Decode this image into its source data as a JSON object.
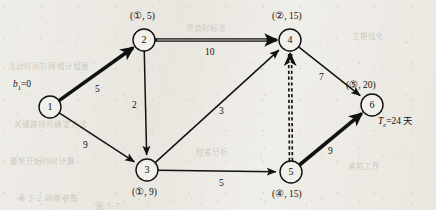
{
  "figure": {
    "type": "project-network-diagram",
    "background_color": "#eceae4",
    "ink_color": "#111111",
    "width": 436,
    "height": 210
  },
  "nodes": [
    {
      "id": "1",
      "number": "1",
      "x": 50,
      "y": 107,
      "r": 11,
      "label": "",
      "label_x": 14,
      "label_y": 80,
      "label_pos": "upper-left"
    },
    {
      "id": "2",
      "number": "2",
      "x": 144,
      "y": 40,
      "r": 11,
      "label": "(①, 5)",
      "label_x": 130,
      "label_y": 10,
      "label_pos": "above"
    },
    {
      "id": "3",
      "number": "3",
      "x": 147,
      "y": 170,
      "r": 11,
      "label": "(①, 9)",
      "label_x": 132,
      "label_y": 186,
      "label_pos": "below"
    },
    {
      "id": "4",
      "number": "4",
      "x": 290,
      "y": 40,
      "r": 11,
      "label": "(②, 15)",
      "label_x": 272,
      "label_y": 10,
      "label_pos": "above"
    },
    {
      "id": "5",
      "number": "5",
      "x": 291,
      "y": 172,
      "r": 11,
      "label": "(④, 15)",
      "label_x": 272,
      "label_y": 188,
      "label_pos": "below"
    },
    {
      "id": "6",
      "number": "6",
      "x": 372,
      "y": 105,
      "r": 11,
      "label": "(⑤, 20)",
      "label_x": 372,
      "label_y": 79,
      "label_pos": "above"
    }
  ],
  "edges": [
    {
      "from": "1",
      "to": "2",
      "weight": "5",
      "style": "bold",
      "weight_x": 95,
      "weight_y": 84
    },
    {
      "from": "1",
      "to": "3",
      "weight": "9",
      "style": "thin",
      "weight_x": 83,
      "weight_y": 140
    },
    {
      "from": "2",
      "to": "3",
      "weight": "2",
      "style": "thin",
      "weight_x": 132,
      "weight_y": 100
    },
    {
      "from": "2",
      "to": "4",
      "weight": "10",
      "style": "bold-double",
      "weight_x": 205,
      "weight_y": 47
    },
    {
      "from": "3",
      "to": "4",
      "weight": "3",
      "style": "thin",
      "weight_x": 219,
      "weight_y": 106
    },
    {
      "from": "3",
      "to": "5",
      "weight": "5",
      "style": "thin",
      "weight_x": 219,
      "weight_y": 178
    },
    {
      "from": "4",
      "to": "6",
      "weight": "7",
      "style": "thin",
      "weight_x": 319,
      "weight_y": 72
    },
    {
      "from": "5",
      "to": "4",
      "weight": "",
      "style": "dashed-double",
      "weight_x": 0,
      "weight_y": 0
    },
    {
      "from": "5",
      "to": "6",
      "weight": "9",
      "style": "bold",
      "weight_x": 328,
      "weight_y": 146
    }
  ],
  "annotations": [
    {
      "name": "source-label",
      "html": "<i>b</i><sub>1</sub>=0",
      "x": 13,
      "y": 79
    },
    {
      "name": "completion-time",
      "html": "<i>T<sub>e</sub></i>=24 天",
      "x": 378,
      "y": 113
    }
  ],
  "bleed_through": [
    {
      "text": "活动时间与网络计划图",
      "x": 8,
      "y": 60
    },
    {
      "text": "关键路线的确定方法",
      "x": 14,
      "y": 118
    },
    {
      "text": "最早开始时间计算",
      "x": 10,
      "y": 155
    },
    {
      "text": "表 5-2 网络参数",
      "x": 18,
      "y": 192
    },
    {
      "text": "节点时标法",
      "x": 186,
      "y": 22
    },
    {
      "text": "工期优化",
      "x": 352,
      "y": 30
    },
    {
      "text": "紧前工作",
      "x": 348,
      "y": 160
    },
    {
      "text": "时差分析",
      "x": 196,
      "y": 146
    },
    {
      "text": "图 5-7",
      "x": 96,
      "y": 200
    }
  ]
}
